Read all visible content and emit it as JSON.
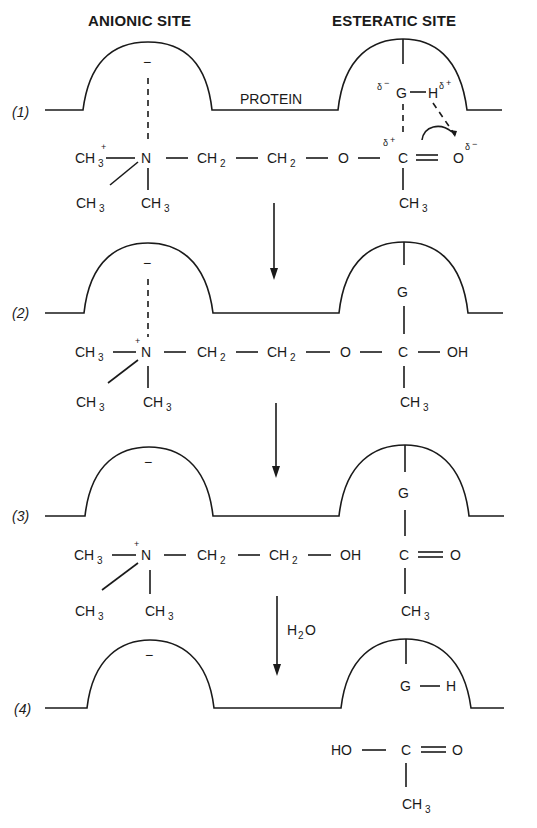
{
  "figure": {
    "headers": {
      "anionic_site": "ANIONIC SITE",
      "esteratic_site": "ESTERATIC SITE"
    },
    "protein_label": "PROTEIN",
    "reagent_label": "H",
    "reagent_sub": "2",
    "reagent_tail": "O",
    "stages": [
      {
        "label": "(1)",
        "description": "Acetylcholine bound: N+ at anionic site, ester carbonyl at esteratic site G–H"
      },
      {
        "label": "(2)",
        "description": "Tetrahedral intermediate: C–OH bound to G"
      },
      {
        "label": "(3)",
        "description": "Choline released; acetylated enzyme G–C(=O)CH3"
      },
      {
        "label": "(4)",
        "description": "Hydrolysis with H2O; acetic acid released; enzyme regenerated G–H"
      }
    ],
    "atoms": {
      "ch3": "CH",
      "three": "3",
      "n": "N",
      "ch2": "CH",
      "two": "2",
      "o": "O",
      "c": "C",
      "oh": "OH",
      "ho": "HO",
      "g": "G",
      "h": "H",
      "minus": "−",
      "plus": "+",
      "delta": "δ",
      "delta_minus": "−",
      "delta_plus": "+"
    }
  }
}
